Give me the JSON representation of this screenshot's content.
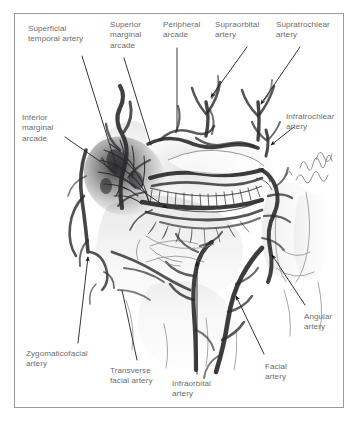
{
  "figure": {
    "style": "pencil and wash anatomical illustration, lateral-oblique view of orbit, eyelids and cheek",
    "border_color": "#9a9a9a",
    "background_color": "#ffffff",
    "label_color": "#6f6c6b",
    "ink_color": "#3a3a3a"
  },
  "labels": [
    {
      "id": "superficial-temporal-artery",
      "text": "Superficial\ntemporal artery",
      "x": 28,
      "y": 24,
      "align": "left"
    },
    {
      "id": "superior-marginal-arcade",
      "text": "Superior\nmarginal\narcade",
      "x": 110,
      "y": 20,
      "align": "left"
    },
    {
      "id": "peripheral-arcade",
      "text": "Peripheral\narcade",
      "x": 163,
      "y": 20,
      "align": "left"
    },
    {
      "id": "supraorbital-artery",
      "text": "Supraorbital\nartery",
      "x": 215,
      "y": 20,
      "align": "left"
    },
    {
      "id": "supratrochlear-artery",
      "text": "Supratrochlear\nartery",
      "x": 276,
      "y": 20,
      "align": "left"
    },
    {
      "id": "inferior-marginal-arcade",
      "text": "Inferior\nmarginal\narcade",
      "x": 22,
      "y": 113,
      "align": "left"
    },
    {
      "id": "infratrochlear-artery",
      "text": "Infratrochlear\nartery",
      "x": 286,
      "y": 112,
      "align": "left"
    },
    {
      "id": "angular-artery",
      "text": "Angular\nartery",
      "x": 304,
      "y": 312,
      "align": "left"
    },
    {
      "id": "zygomaticofacial-artery",
      "text": "Zygomaticofacial\nartery",
      "x": 26,
      "y": 349,
      "align": "left"
    },
    {
      "id": "transverse-facial-artery",
      "text": "Transverse\nfacial artery",
      "x": 110,
      "y": 366,
      "align": "left"
    },
    {
      "id": "infraorbital-artery",
      "text": "Infraorbital\nartery",
      "x": 172,
      "y": 379,
      "align": "left"
    },
    {
      "id": "facial-artery",
      "text": "Facial\nartery",
      "x": 265,
      "y": 362,
      "align": "left"
    }
  ],
  "leaders": [
    {
      "id": "leader-superficial-temporal",
      "from": [
        82,
        56
      ],
      "to": [
        117,
        168
      ],
      "arrow": false
    },
    {
      "id": "leader-superior-marginal",
      "from": [
        124,
        58
      ],
      "to": [
        151,
        145
      ],
      "arrow": false
    },
    {
      "id": "leader-peripheral-arcade",
      "from": [
        177,
        48
      ],
      "to": [
        177,
        131
      ],
      "arrow": false
    },
    {
      "id": "leader-supraorbital",
      "from": [
        247,
        47
      ],
      "to": [
        211,
        97
      ],
      "arrow": true
    },
    {
      "id": "leader-supratrochlear",
      "from": [
        300,
        47
      ],
      "to": [
        261,
        104
      ],
      "arrow": true
    },
    {
      "id": "leader-inferior-marginal",
      "from": [
        65,
        137
      ],
      "to": [
        167,
        208
      ],
      "arrow": true
    },
    {
      "id": "leader-infratrochlear",
      "from": [
        294,
        127
      ],
      "to": [
        271,
        145
      ],
      "arrow": true
    },
    {
      "id": "leader-angular",
      "from": [
        305,
        305
      ],
      "to": [
        272,
        255
      ],
      "arrow": true
    },
    {
      "id": "leader-zygomaticofacial",
      "from": [
        78,
        343
      ],
      "to": [
        88,
        257
      ],
      "arrow": true
    },
    {
      "id": "leader-transverse-facial",
      "from": [
        137,
        360
      ],
      "to": [
        122,
        290
      ],
      "arrow": false
    },
    {
      "id": "leader-infraorbital",
      "from": [
        197,
        374
      ],
      "to": [
        197,
        262
      ],
      "arrow": true
    },
    {
      "id": "leader-facial",
      "from": [
        264,
        354
      ],
      "to": [
        236,
        296
      ],
      "arrow": true
    }
  ],
  "anatomy": {
    "structures": [
      "superficial temporal artery trunk, ascending pre-auricular",
      "superior marginal (tarsal) arcade along upper lid margin",
      "peripheral arcade above the upper tarsus",
      "supraorbital artery emerging from supraorbital notch",
      "supratrochlear artery emerging medially",
      "infratrochlear artery at medial canthus",
      "inferior marginal arcade along lower lid margin",
      "angular artery ascending beside the nose",
      "facial artery ascending along the nasolabial fold",
      "infraorbital artery emerging from the infraorbital foramen",
      "transverse facial artery crossing the cheek",
      "zygomaticofacial artery at the lateral cheek",
      "tarsal plate with meibomian gland striations",
      "eyelashes along lid margins",
      "nasal dorsum and alar contours in pencil outline"
    ]
  }
}
